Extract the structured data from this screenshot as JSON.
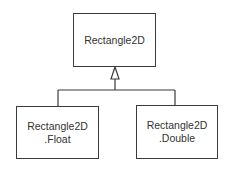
{
  "diagram": {
    "type": "class-hierarchy",
    "parent": {
      "name": "Rectangle2D",
      "lines": [
        "Rectangle2D"
      ]
    },
    "children": [
      {
        "name": "Rectangle2D.Float",
        "lines": [
          "Rectangle2D",
          ".Float"
        ]
      },
      {
        "name": "Rectangle2D.Double",
        "lines": [
          "Rectangle2D",
          ".Double"
        ]
      }
    ],
    "relationship": "inheritance (hollow triangle arrow toward parent)"
  }
}
